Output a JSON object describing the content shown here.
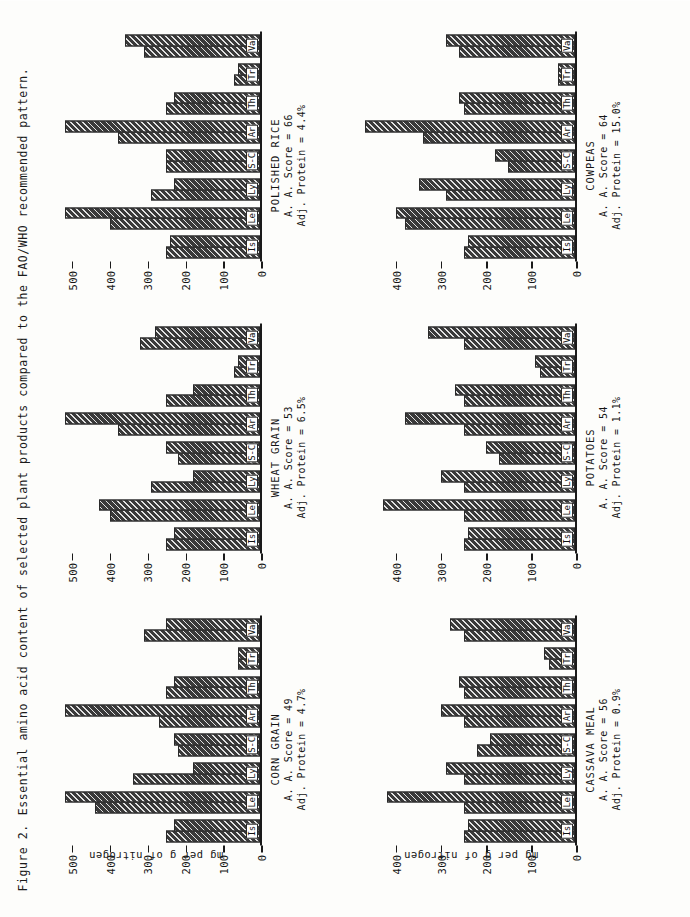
{
  "figure": {
    "number_label": "Figure 2.",
    "caption": "Essential amino acid content of selected plant products compared to the FAO/WHO recommended pattern.",
    "y_axis_title": "mg per g of nitrogen",
    "score_label_prefix": "A. A. Score = ",
    "protein_label_prefix": "Adj. Protein = "
  },
  "chart_data": [
    {
      "type": "bar",
      "title": "CORN GRAIN",
      "subtitle_1": "A. A. Score = 49",
      "subtitle_2": "Adj. Protein = 4.7%",
      "aa_score": 49,
      "adj_protein_pct": 4.7,
      "xlabel": "",
      "ylabel": "mg per g of nitrogen",
      "ylim": [
        0,
        560
      ],
      "yticks": [
        0,
        100,
        200,
        300,
        400,
        500
      ],
      "grid": false,
      "legend": "none",
      "categories": [
        "Is",
        "Le",
        "Ly",
        "S-C",
        "Ar",
        "Th",
        "Tr",
        "Va"
      ],
      "series": [
        {
          "name": "FAO/WHO reference pattern",
          "values": [
            250,
            440,
            340,
            220,
            270,
            250,
            60,
            310
          ]
        },
        {
          "name": "Corn grain content",
          "values": [
            230,
            520,
            180,
            230,
            520,
            230,
            60,
            250
          ]
        }
      ]
    },
    {
      "type": "bar",
      "title": "WHEAT GRAIN",
      "subtitle_1": "A. A. Score = 53",
      "subtitle_2": "Adj. Protein = 6.5%",
      "aa_score": 53,
      "adj_protein_pct": 6.5,
      "xlabel": "",
      "ylabel": "mg per g of nitrogen",
      "ylim": [
        0,
        560
      ],
      "yticks": [
        0,
        100,
        200,
        300,
        400,
        500
      ],
      "grid": false,
      "legend": "none",
      "categories": [
        "Is",
        "Le",
        "Ly",
        "S-C",
        "Ar",
        "Th",
        "Tr",
        "Va"
      ],
      "series": [
        {
          "name": "FAO/WHO reference pattern",
          "values": [
            250,
            400,
            290,
            220,
            380,
            250,
            70,
            320
          ]
        },
        {
          "name": "Wheat grain content",
          "values": [
            230,
            430,
            180,
            250,
            520,
            180,
            60,
            280
          ]
        }
      ]
    },
    {
      "type": "bar",
      "title": "POLISHED RICE",
      "subtitle_1": "A. A. Score = 66",
      "subtitle_2": "Adj. Protein = 4.4%",
      "aa_score": 66,
      "adj_protein_pct": 4.4,
      "xlabel": "",
      "ylabel": "mg per g of nitrogen",
      "ylim": [
        0,
        560
      ],
      "yticks": [
        0,
        100,
        200,
        300,
        400,
        500
      ],
      "grid": false,
      "legend": "none",
      "categories": [
        "Is",
        "Le",
        "Ly",
        "S-C",
        "Ar",
        "Th",
        "Tr",
        "Va"
      ],
      "series": [
        {
          "name": "FAO/WHO reference pattern",
          "values": [
            250,
            400,
            290,
            250,
            380,
            250,
            70,
            310
          ]
        },
        {
          "name": "Polished rice content",
          "values": [
            240,
            520,
            230,
            250,
            520,
            230,
            60,
            360
          ]
        }
      ]
    },
    {
      "type": "bar",
      "title": "CASSAVA MEAL",
      "subtitle_1": "A. A. Score = 56",
      "subtitle_2": "Adj. Protein = 0.9%",
      "aa_score": 56,
      "adj_protein_pct": 0.9,
      "xlabel": "",
      "ylabel": "mg per g of nitrogen",
      "ylim": [
        0,
        470
      ],
      "yticks": [
        0,
        100,
        200,
        300,
        400,
        500
      ],
      "grid": false,
      "legend": "none",
      "categories": [
        "Is",
        "Le",
        "Ly",
        "S-C",
        "Ar",
        "Th",
        "Tr",
        "Va"
      ],
      "series": [
        {
          "name": "FAO/WHO reference pattern",
          "values": [
            250,
            250,
            250,
            220,
            250,
            250,
            60,
            250
          ]
        },
        {
          "name": "Cassava meal content",
          "values": [
            240,
            420,
            290,
            190,
            300,
            260,
            70,
            280
          ]
        }
      ]
    },
    {
      "type": "bar",
      "title": "POTATOES",
      "subtitle_1": "A. A. Score = 54",
      "subtitle_2": "Adj. Protein = 1.1%",
      "aa_score": 54,
      "adj_protein_pct": 1.1,
      "xlabel": "",
      "ylabel": "mg per g of nitrogen",
      "ylim": [
        0,
        470
      ],
      "yticks": [
        0,
        100,
        200,
        300,
        400,
        500
      ],
      "grid": false,
      "legend": "none",
      "categories": [
        "Is",
        "Le",
        "Ly",
        "S-C",
        "Ar",
        "Th",
        "Tr",
        "Va"
      ],
      "series": [
        {
          "name": "FAO/WHO reference pattern",
          "values": [
            250,
            250,
            250,
            170,
            250,
            250,
            80,
            250
          ]
        },
        {
          "name": "Potato content",
          "values": [
            240,
            430,
            300,
            200,
            380,
            270,
            90,
            330
          ]
        }
      ]
    },
    {
      "type": "bar",
      "title": "COWPEAS",
      "subtitle_1": "A. A. Score = 64",
      "subtitle_2": "Adj. Protein = 15.0%",
      "aa_score": 64,
      "adj_protein_pct": 15.0,
      "xlabel": "",
      "ylabel": "mg per g of nitrogen",
      "ylim": [
        0,
        470
      ],
      "yticks": [
        0,
        100,
        200,
        300,
        400,
        500
      ],
      "grid": false,
      "legend": "none",
      "categories": [
        "Is",
        "Le",
        "Ly",
        "S-C",
        "Ar",
        "Th",
        "Tr",
        "Va"
      ],
      "series": [
        {
          "name": "FAO/WHO reference pattern",
          "values": [
            250,
            380,
            290,
            150,
            340,
            250,
            40,
            260
          ]
        },
        {
          "name": "Cowpea content",
          "values": [
            240,
            400,
            350,
            180,
            470,
            260,
            40,
            290
          ]
        }
      ]
    }
  ]
}
